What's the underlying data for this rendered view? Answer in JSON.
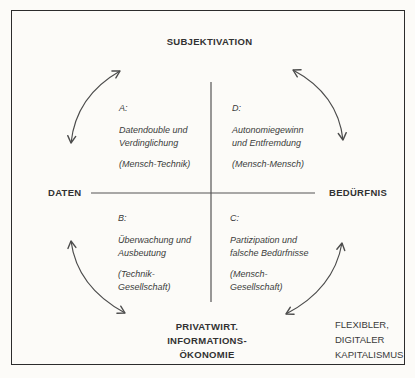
{
  "figure": {
    "poles": {
      "top": "SUBJEKTIVATION",
      "left": "DATEN",
      "right": "BEDÜRFNIS",
      "bottom_lines": [
        "PRIVATWIRT.",
        "INFORMATIONS-",
        "ÖKONOMIE"
      ]
    },
    "corner_note_lines": [
      "FLEXIBLER,",
      "DIGITALER",
      "KAPITALISMUS"
    ],
    "quadrants": {
      "A": {
        "id": "A:",
        "title": [
          "Datendouble und",
          "Verdinglichung"
        ],
        "relation": [
          "(Mensch-Technik)"
        ]
      },
      "D": {
        "id": "D:",
        "title": [
          "Autonomiegewinn",
          "und Entfremdung"
        ],
        "relation": [
          "(Mensch-Mensch)"
        ]
      },
      "B": {
        "id": "B:",
        "title": [
          "Überwachung und",
          "Ausbeutung"
        ],
        "relation": [
          "(Technik-",
          "Gesellschaft)"
        ]
      },
      "C": {
        "id": "C:",
        "title": [
          "Partizipation und",
          "falsche Bedürfnisse"
        ],
        "relation": [
          "(Mensch-",
          "Gesellschaft)"
        ]
      }
    },
    "icons": {
      "arrow_top_left": "curved-double-arrow",
      "arrow_top_right": "curved-double-arrow",
      "arrow_bottom_left": "curved-double-arrow",
      "arrow_bottom_right": "curved-double-arrow",
      "axis_cross": "coordinate-cross"
    },
    "colors": {
      "paper": "#fcfbf8",
      "ink": "#3a3a3a",
      "line": "#4c4c4c",
      "border": "#2c2c2c"
    }
  }
}
